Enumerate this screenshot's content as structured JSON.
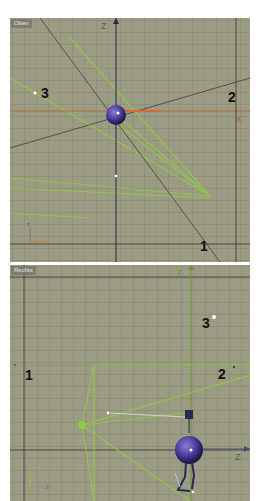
{
  "viewports": [
    {
      "label": "Oben",
      "axis_labels": {
        "vertical": "Z",
        "horizontal": "X"
      },
      "gizmo": {
        "vertical": "z",
        "horizontal": "x"
      },
      "markers": [
        {
          "id": "3",
          "text": "3"
        },
        {
          "id": "2",
          "text": "2"
        },
        {
          "id": "1",
          "text": "1"
        }
      ]
    },
    {
      "label": "Rechts",
      "axis_labels": {
        "vertical": "Y",
        "horizontal": "Z"
      },
      "gizmo": {
        "vertical": "y",
        "horizontal": "z"
      },
      "markers": [
        {
          "id": "1",
          "text": "1"
        },
        {
          "id": "3",
          "text": "3"
        },
        {
          "id": "2",
          "text": "2"
        }
      ]
    }
  ],
  "colors": {
    "viewport_bg": "#9c9c84",
    "grid_line": "#7e806a",
    "axis_line": "#3a3a3a",
    "x_axis": "#c8743a",
    "light_green": "#8fd040",
    "sphere": "#4a3e9a"
  }
}
